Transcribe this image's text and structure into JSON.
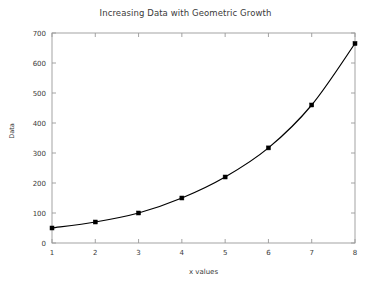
{
  "chart_data": {
    "type": "line",
    "title": "Increasing Data with Geometric Growth",
    "xlabel": "x values",
    "ylabel": "Data",
    "x": [
      1,
      2,
      3,
      4,
      5,
      6,
      7,
      8
    ],
    "values": [
      50,
      70,
      100,
      150,
      220,
      317,
      460,
      665
    ],
    "series": [
      {
        "name": "Data",
        "x": [
          1,
          2,
          3,
          4,
          5,
          6,
          7,
          8
        ],
        "values": [
          50,
          70,
          100,
          150,
          220,
          317,
          460,
          665
        ]
      }
    ],
    "xlim": [
      1,
      8
    ],
    "ylim": [
      0,
      700
    ],
    "xticks": [
      "1",
      "2",
      "3",
      "4",
      "5",
      "6",
      "7",
      "8"
    ],
    "yticks": [
      "0",
      "100",
      "200",
      "300",
      "400",
      "500",
      "600",
      "700"
    ],
    "xtick_values": [
      1,
      2,
      3,
      4,
      5,
      6,
      7,
      8
    ],
    "ytick_values": [
      0,
      100,
      200,
      300,
      400,
      500,
      600,
      700
    ],
    "grid": false,
    "legend": "none",
    "marker": "square",
    "line_color": "#000000",
    "marker_color": "#000000",
    "axis_color": "#9a9a9a",
    "background_color": "#ffffff"
  }
}
